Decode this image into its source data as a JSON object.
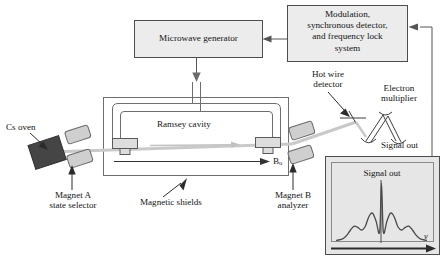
{
  "figure": {
    "type": "block-diagram"
  },
  "blocks": {
    "microwave_generator": {
      "label": "Microwave generator"
    },
    "control_system": {
      "line1": "Modulation,",
      "line2": "synchronous detector,",
      "line3": "and frequency lock",
      "line4": "system"
    }
  },
  "labels": {
    "cs_oven": "Cs oven",
    "magnet_a_line1": "Magnet A",
    "magnet_a_line2": "state selector",
    "ramsey_cavity": "Ramsey cavity",
    "magnetic_shields": "Magnetic shields",
    "b_field": "B",
    "b_field_sub": "o",
    "magnet_b_line1": "Magnet B",
    "magnet_b_line2": "analyzer",
    "hot_wire_line1": "Hot wire",
    "hot_wire_line2": "detector",
    "electron_multiplier_line1": "Electron",
    "electron_multiplier_line2": "multiplier",
    "signal_out": "Signal out"
  },
  "inset": {
    "title": "Signal out",
    "x_axis_label": "ν"
  },
  "chart_data": {
    "type": "line",
    "title": "Signal out",
    "xlabel": "ν",
    "ylabel": "",
    "x": [
      0,
      4,
      8,
      12,
      16,
      20,
      24,
      28,
      32,
      36,
      40,
      44,
      48,
      50,
      52,
      56,
      60,
      64,
      68,
      72,
      76,
      80,
      84,
      88,
      92,
      96,
      100
    ],
    "values": [
      4,
      5,
      7,
      12,
      20,
      26,
      24,
      20,
      25,
      40,
      46,
      34,
      17,
      8,
      17,
      34,
      46,
      40,
      25,
      20,
      24,
      26,
      20,
      12,
      7,
      5,
      4
    ],
    "center_peak": {
      "x": 50,
      "y": 92
    },
    "ylim": [
      0,
      100
    ],
    "xlim": [
      0,
      100
    ],
    "grid": false,
    "legend": null
  },
  "colors": {
    "line": "#555555",
    "box_fill": "#ececec",
    "box_stroke": "#4d4d4d",
    "oven_fill": "#454545",
    "magnet_fill": "#cfcfcf",
    "beam": "#c9c9c9",
    "inset_fill": "#e6e6e6",
    "text": "#141414"
  }
}
